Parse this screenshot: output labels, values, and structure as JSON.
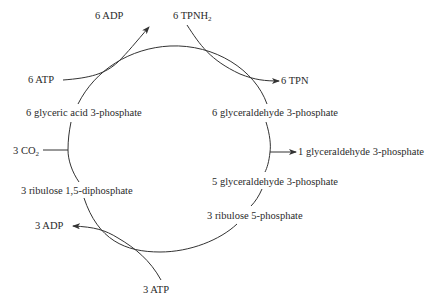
{
  "diagram": {
    "cycle_nodes": [
      {
        "id": "pga",
        "label": "6 glyceric acid 3-phosphate"
      },
      {
        "id": "gap6",
        "label": "6 glyceraldehyde 3-phosphate"
      },
      {
        "id": "gap5",
        "label": "5 glyceraldehyde 3-phosphate"
      },
      {
        "id": "ru5p",
        "label": "3 ribulose 5-phosphate"
      },
      {
        "id": "rudp",
        "label": "3 ribulose 1,5-diphosphate"
      }
    ],
    "side_inputs_outputs": {
      "atp6": "6 ATP",
      "adp6": "6 ADP",
      "tpnh2_prefix": "6 TPNH",
      "tpnh2_sub": "2",
      "tpn6": "6 TPN",
      "co2_prefix": "3 CO",
      "co2_sub": "2",
      "gap_out": "1 glyceraldehyde 3-phosphate",
      "atp3": "3 ATP",
      "adp3": "3 ADP"
    },
    "edges": [
      {
        "from": "6 ATP",
        "to": "6 ADP",
        "coupled_step": "pga -> gap6"
      },
      {
        "from": "6 TPNH2",
        "to": "6 TPN",
        "coupled_step": "pga -> gap6"
      },
      {
        "from": "3 CO2",
        "to": "pga",
        "coupled_step": "rudp -> pga"
      },
      {
        "from": "gap6",
        "to": "1 glyceraldehyde 3-phosphate",
        "branch": true
      },
      {
        "from": "3 ATP",
        "to": "3 ADP",
        "coupled_step": "ru5p -> rudp"
      }
    ],
    "colors": {
      "line": "#333333",
      "text": "#2a2a2a",
      "background": "#ffffff"
    }
  }
}
